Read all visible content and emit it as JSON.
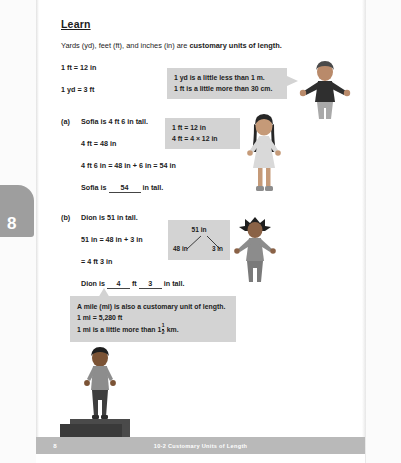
{
  "page": {
    "tab_number": "8",
    "footer_label": "10-2  Customary Units of Length",
    "footer_page_number": "8"
  },
  "lesson": {
    "heading": "Learn",
    "intro_plain": "Yards (yd), feet (ft), and inches (in) are ",
    "intro_bold": "customary units of length.",
    "conversion_1": "1 ft = 12 in",
    "conversion_2": "1 yd = 3 ft"
  },
  "callouts": {
    "metric": {
      "line1": "1 yd is a little less than 1 m.",
      "line2": "1 ft is a little more than 30 cm."
    },
    "feet_to_inches": {
      "line1": "1 ft = 12 in",
      "line2": "4 ft = 4 × 12 in"
    },
    "mile": {
      "line1": "A mile (mi) is also a customary unit of length.",
      "line2": "1 mi = 5,280 ft",
      "line3_pre": "1 mi is a little more than 1",
      "line3_frac_num": "1",
      "line3_frac_den": "2",
      "line3_post": " km."
    }
  },
  "number_bond": {
    "total": "51 in",
    "part_left": "48 in",
    "part_right": "3 in"
  },
  "part_a": {
    "label": "(a)",
    "prompt": "Sofia is 4 ft 6 in tall.",
    "step1": "4 ft = 48 in",
    "step2": "4 ft 6 in = 48 in + 6 in = 54 in",
    "answer_pre": "Sofia is",
    "answer_value": "54",
    "answer_post": "in tall."
  },
  "part_b": {
    "label": "(b)",
    "prompt": "Dion is 51 in tall.",
    "step1": "51 in = 48 in + 3 in",
    "step2": "= 4 ft 3 in",
    "answer_pre": "Dion is",
    "answer_value_ft": "4",
    "answer_mid": "ft",
    "answer_value_in": "3",
    "answer_post": "in tall."
  },
  "figures": {
    "teacher": "teacher-figure",
    "sofia": "sofia-figure",
    "dion": "dion-figure",
    "boy_on_block": "boy-on-block-figure"
  },
  "colors": {
    "box_gray": "#d3d3d3",
    "footer_gray": "#b9b9b9",
    "tab_gray": "#9e9e9e"
  }
}
